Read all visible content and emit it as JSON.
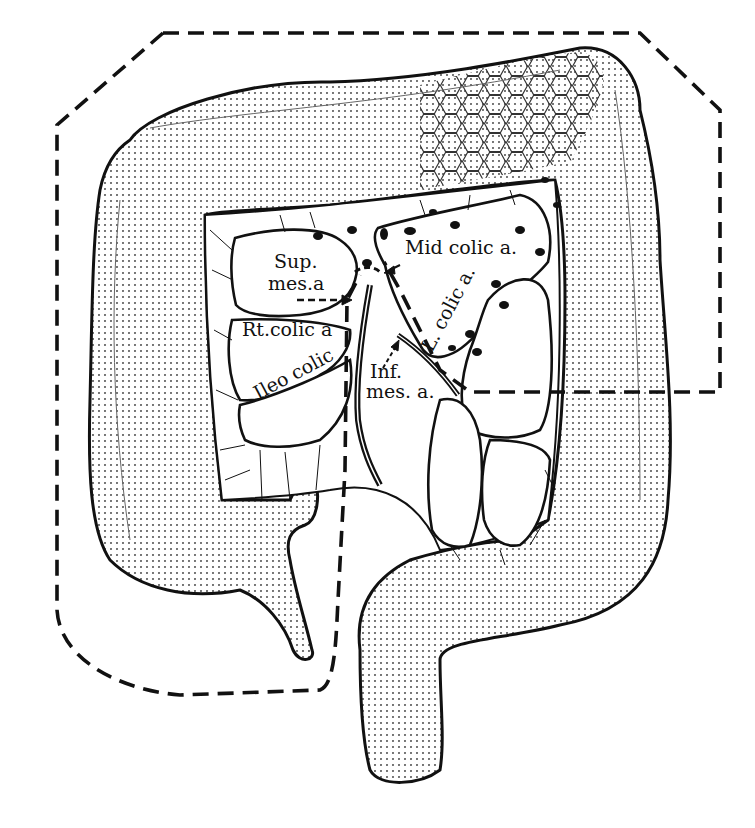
{
  "diagram": {
    "type": "anatomical-illustration",
    "colors": {
      "ink": "#111111",
      "background": "#ffffff",
      "stipple": "#7a7a7a"
    },
    "labels": {
      "sup_mes_1": "Sup.",
      "sup_mes_2": "mes.a",
      "mid_colic": "Mid colic a.",
      "rt_colic": "Rt.colic a",
      "ileo_colic": "Ileo colic",
      "l_colic": "L. colic a.",
      "inf_mes_1": "Inf.",
      "inf_mes_2": "mes. a."
    },
    "regions": [
      "ascending colon",
      "transverse colon",
      "descending colon",
      "sigmoid colon",
      "rectum",
      "cecum with appendix",
      "terminal ileum",
      "tumor (hexagon-patterned, splenic flexure)",
      "mesentery with lymph nodes"
    ],
    "boundary": "dashed resection line"
  }
}
